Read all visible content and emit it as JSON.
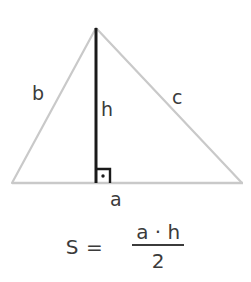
{
  "figure": {
    "colors": {
      "triangle_stroke": "#c9c9c9",
      "height_stroke": "#1a1a1a",
      "text": "#3b3b3b",
      "background": "#ffffff"
    },
    "triangle": {
      "apex": [
        96,
        28
      ],
      "bottom_left": [
        12,
        183
      ],
      "bottom_right": [
        242,
        183
      ]
    },
    "height_line": {
      "from": [
        96,
        28
      ],
      "to": [
        96,
        183
      ]
    },
    "right_angle_marker": {
      "x": 96,
      "y": 169,
      "size": 14,
      "dot": true
    },
    "labels": {
      "side_b": "b",
      "height_h": "h",
      "side_c": "c",
      "base_a": "a"
    }
  },
  "formula": {
    "lhs": "S =",
    "numerator": "a · h",
    "denominator": "2"
  }
}
